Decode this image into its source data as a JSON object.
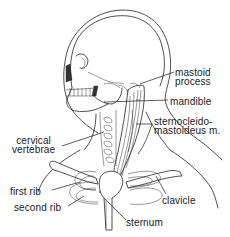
{
  "figure": {
    "style": "black line illustration on white background"
  },
  "labels": {
    "mastoid_process": {
      "line1": "mastoid",
      "line2": "process"
    },
    "mandible": {
      "text": "mandible"
    },
    "sternocleidomastoideus": {
      "line1": "sternocleido-",
      "line2": "mastoideus m."
    },
    "cervical_vertebrae": {
      "line1": "cervical",
      "line2": "vertebrae"
    },
    "first_rib": {
      "text": "first rib"
    },
    "second_rib": {
      "text": "second rib"
    },
    "clavicle": {
      "text": "clavicle"
    },
    "sternum": {
      "text": "sternum"
    }
  },
  "colors": {
    "line": "#222222",
    "background": "#ffffff",
    "text": "#1a1a1a"
  }
}
